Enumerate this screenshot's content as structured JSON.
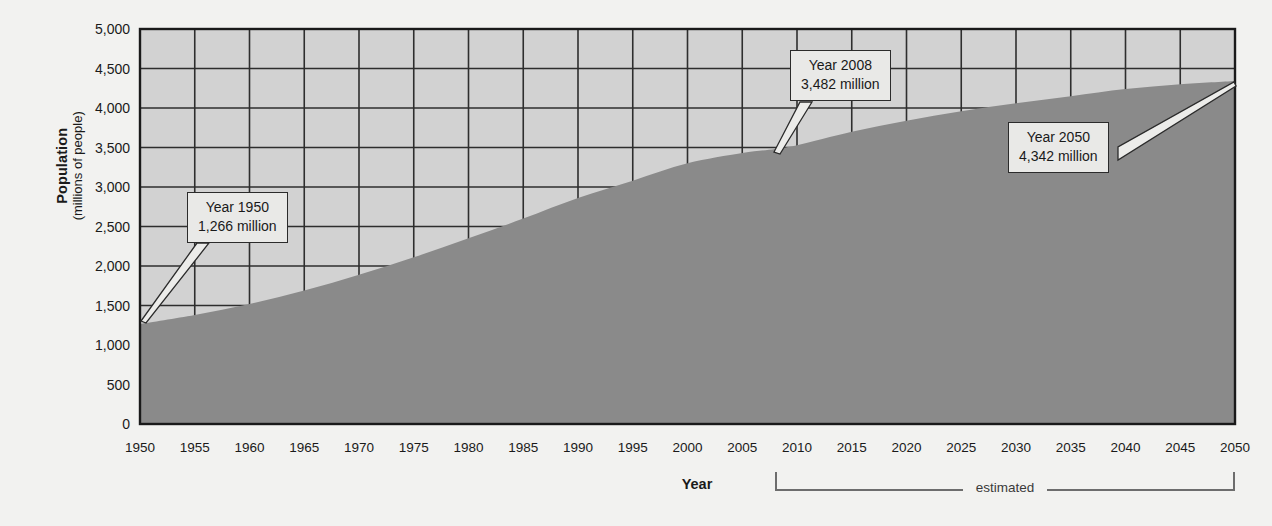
{
  "chart_data": {
    "type": "area",
    "title": "",
    "xlabel": "Year",
    "ylabel": "Population",
    "ylabel_sub": "(millions of people)",
    "xlim": [
      1950,
      2050
    ],
    "ylim": [
      0,
      5000
    ],
    "grid": true,
    "legend": "none",
    "y_ticks": [
      "0",
      "500",
      "1,000",
      "1,500",
      "2,000",
      "2,500",
      "3,000",
      "3,500",
      "4,000",
      "4,500",
      "5,000"
    ],
    "y_tick_values": [
      0,
      500,
      1000,
      1500,
      2000,
      2500,
      3000,
      3500,
      4000,
      4500,
      5000
    ],
    "x_ticks": [
      "1950",
      "1955",
      "1960",
      "1965",
      "1970",
      "1975",
      "1980",
      "1985",
      "1990",
      "1995",
      "2000",
      "2005",
      "2010",
      "2015",
      "2020",
      "2025",
      "2030",
      "2035",
      "2040",
      "2045",
      "2050"
    ],
    "x_tick_values": [
      1950,
      1955,
      1960,
      1965,
      1970,
      1975,
      1980,
      1985,
      1990,
      1995,
      2000,
      2005,
      2010,
      2015,
      2020,
      2025,
      2030,
      2035,
      2040,
      2045,
      2050
    ],
    "x": [
      1950,
      1955,
      1960,
      1965,
      1970,
      1975,
      1980,
      1985,
      1990,
      1995,
      2000,
      2005,
      2008,
      2010,
      2015,
      2020,
      2025,
      2030,
      2035,
      2040,
      2045,
      2050
    ],
    "values": [
      1266,
      1380,
      1520,
      1690,
      1890,
      2110,
      2350,
      2600,
      2860,
      3080,
      3300,
      3430,
      3482,
      3530,
      3700,
      3840,
      3960,
      4060,
      4150,
      4240,
      4300,
      4342
    ],
    "series": [
      {
        "name": "Population",
        "values": [
          1266,
          1380,
          1520,
          1690,
          1890,
          2110,
          2350,
          2600,
          2860,
          3080,
          3300,
          3430,
          3482,
          3530,
          3700,
          3840,
          3960,
          4060,
          4150,
          4240,
          4300,
          4342
        ]
      }
    ],
    "annotations": [
      {
        "id": "callout-1950",
        "line1": "Year 1950",
        "line2": "1,266 million",
        "x": 1950,
        "y": 1266
      },
      {
        "id": "callout-2008",
        "line1": "Year 2008",
        "line2": "3,482 million",
        "x": 2008,
        "y": 3482
      },
      {
        "id": "callout-2050",
        "line1": "Year 2050",
        "line2": "4,342 million",
        "x": 2050,
        "y": 4342
      }
    ],
    "estimated_bracket": {
      "label": "estimated",
      "from": 2008,
      "to": 2050
    },
    "colors": {
      "plot_background": "#d2d2d2",
      "area_fill": "#8a8a8a",
      "grid": "#2e2e2e",
      "axis": "#1a1a1a",
      "page_background": "#f2f2f0",
      "callout_fill": "#e9e9e7",
      "callout_border": "#2b2b2b",
      "bracket": "#6d6d6d"
    }
  }
}
